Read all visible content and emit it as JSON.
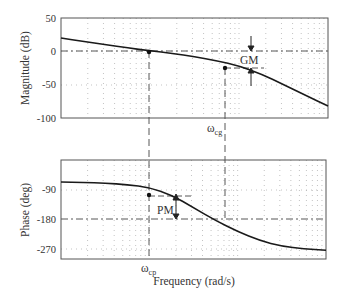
{
  "chart_data": [
    {
      "type": "line",
      "title": "",
      "panel": "magnitude",
      "xlabel": "",
      "ylabel": "Magnitude (dB)",
      "xscale": "log",
      "x_decades": 3,
      "ylim": [
        -100,
        50
      ],
      "yticks": [
        50,
        0,
        -50,
        -100
      ],
      "ytick_labels": [
        "50",
        "0",
        "-50",
        "-100"
      ],
      "grid": true,
      "x": [
        0,
        0.25,
        0.5,
        0.75,
        1.0,
        1.25,
        1.5,
        1.75,
        2.0,
        2.25,
        2.5,
        2.75,
        3.0
      ],
      "x_unit": "decades from left edge",
      "series": [
        {
          "name": "Magnitude",
          "values": [
            20,
            15,
            10,
            5,
            1,
            -3,
            -8,
            -14,
            -22,
            -34,
            -50,
            -66,
            -82
          ]
        }
      ],
      "annotations": [
        {
          "text": "GM",
          "x": 1.87,
          "y": -12,
          "desc": "gain margin between 0 dB line and magnitude at phase crossover"
        },
        {
          "text": "ωcg",
          "x": 1.84,
          "desc": "marker on frequency axis below magnitude plot"
        },
        {
          "marker": "dot",
          "x": 1.84,
          "y": -25
        },
        {
          "line": "dash-dot horizontal at 0 dB"
        },
        {
          "line": "dashed horizontal at GM reference"
        }
      ]
    },
    {
      "type": "line",
      "title": "",
      "panel": "phase",
      "xlabel": "Frequency (rad/s)",
      "ylabel": "Phase (deg)",
      "xscale": "log",
      "x_decades": 3,
      "ylim": [
        -300,
        0
      ],
      "yticks": [
        -90,
        -180,
        -270
      ],
      "ytick_labels": [
        "-90",
        "-180",
        "-270"
      ],
      "grid": true,
      "x": [
        0,
        0.25,
        0.5,
        0.75,
        1.0,
        1.25,
        1.5,
        1.75,
        2.0,
        2.25,
        2.5,
        2.75,
        3.0
      ],
      "x_unit": "decades from left edge",
      "series": [
        {
          "name": "Phase",
          "values": [
            -90,
            -91,
            -93,
            -97,
            -105,
            -125,
            -160,
            -195,
            -225,
            -250,
            -265,
            -272,
            -276
          ]
        }
      ],
      "annotations": [
        {
          "text": "PM",
          "x": 1.15,
          "y": -140,
          "desc": "phase margin between -180 deg line and phase at gain crossover"
        },
        {
          "text": "ωcp",
          "x": 0.99,
          "desc": "marker on frequency axis below phase plot"
        },
        {
          "marker": "dot",
          "x": 0.99,
          "y": -104
        },
        {
          "line": "dash-dot horizontal at -180 deg"
        }
      ]
    }
  ],
  "labels": {
    "mag_ylabel": "Magnitude (dB)",
    "phase_ylabel": "Phase (deg)",
    "xlabel": "Frequency (rad/s)",
    "gm": "GM",
    "pm": "PM",
    "omega": "ω",
    "cg_sub": "cg",
    "cp_sub": "cp",
    "mag_ticks": [
      "50",
      "0",
      "-50",
      "-100"
    ],
    "phase_ticks": [
      "-90",
      "-180",
      "-270"
    ]
  }
}
